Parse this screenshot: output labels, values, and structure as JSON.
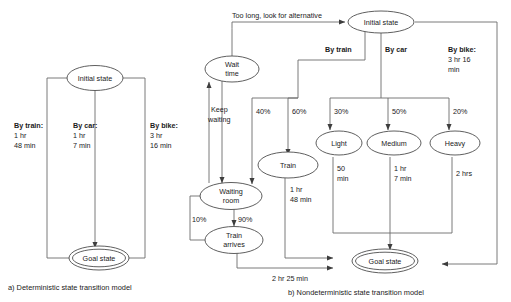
{
  "figure": {
    "left_caption": "a) Deterministic state transition model",
    "right_caption": "b) Nondeterministic state transition model"
  },
  "deterministic": {
    "nodes": {
      "initial": "Initial state",
      "goal": "Goal state"
    },
    "edges": [
      {
        "name": "by-train",
        "head": "By train:",
        "line2": "1 hr",
        "line3": "48 min"
      },
      {
        "name": "by-car",
        "head": "By car:",
        "line2": "1 hr",
        "line3": "7 min"
      },
      {
        "name": "by-bike",
        "head": "By bike:",
        "line2": "3 hr",
        "line3": "16 min"
      }
    ]
  },
  "nondeterministic": {
    "nodes": {
      "initial": "Initial state",
      "wait_time_l1": "Wait",
      "wait_time_l2": "time",
      "waiting_room_l1": "Waiting",
      "waiting_room_l2": "room",
      "train_arrives_l1": "Train",
      "train_arrives_l2": "arrives",
      "train": "Train",
      "light": "Light",
      "medium": "Medium",
      "heavy": "Heavy",
      "goal": "Goal state"
    },
    "labels": {
      "too_long": "Too long, look for alternative",
      "by_train": "By train",
      "by_car": "By car",
      "by_bike_head": "By bike:",
      "by_bike_l2": "3 hr 16",
      "by_bike_l3": "min",
      "keep_waiting_l1": "Keep",
      "keep_waiting_l2": "waiting",
      "p40": "40%",
      "p60": "60%",
      "p30": "30%",
      "p50": "50%",
      "p20": "20%",
      "p10": "10%",
      "p90": "90%",
      "train_time_l1": "1 hr",
      "train_time_l2": "48 min",
      "light_time_l1": "50",
      "light_time_l2": "min",
      "medium_time_l1": "1 hr",
      "medium_time_l2": "7 min",
      "heavy_time": "2 hrs",
      "bike_total": "2 hr 25 min"
    }
  },
  "colors": {
    "stroke": "#6b6b6b",
    "node_stroke": "#4d4d4d",
    "text": "#1a1a1a",
    "background": "#ffffff"
  }
}
